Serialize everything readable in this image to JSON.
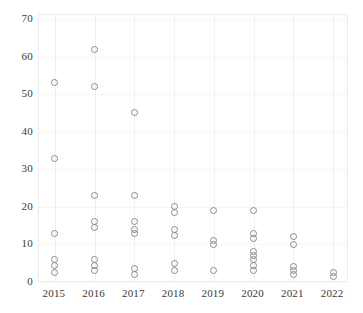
{
  "chart_data": {
    "type": "scatter",
    "title": "",
    "subtitle": "",
    "xlabel": "",
    "ylabel": "",
    "xlim": [
      2014.6,
      2022.4
    ],
    "ylim": [
      0,
      70
    ],
    "yticks": [
      0,
      10,
      20,
      30,
      40,
      50,
      60,
      70
    ],
    "xticks": [
      2015,
      2016,
      2017,
      2018,
      2019,
      2020,
      2021,
      2022
    ],
    "ytick_labels": [
      "0",
      "10",
      "20",
      "30",
      "40",
      "50",
      "60",
      "70"
    ],
    "xtick_labels": [
      "2015",
      "2016",
      "2017",
      "2018",
      "2019",
      "2020",
      "2021",
      "2022"
    ],
    "grid": "light vertical gridlines at each year, faint horizontal gridlines",
    "legend": "none",
    "marker_style": "open circle",
    "marker_color": "#8a8a8a",
    "series": [
      {
        "name": "observations",
        "points": [
          {
            "x": 2015,
            "y": 53
          },
          {
            "x": 2015,
            "y": 33
          },
          {
            "x": 2015,
            "y": 13
          },
          {
            "x": 2015,
            "y": 6
          },
          {
            "x": 2015,
            "y": 4.5
          },
          {
            "x": 2015,
            "y": 2.5
          },
          {
            "x": 2016,
            "y": 62
          },
          {
            "x": 2016,
            "y": 52
          },
          {
            "x": 2016,
            "y": 23
          },
          {
            "x": 2016,
            "y": 16
          },
          {
            "x": 2016,
            "y": 14.5
          },
          {
            "x": 2016,
            "y": 6
          },
          {
            "x": 2016,
            "y": 4.5
          },
          {
            "x": 2016,
            "y": 3
          },
          {
            "x": 2017,
            "y": 45
          },
          {
            "x": 2017,
            "y": 23
          },
          {
            "x": 2017,
            "y": 16
          },
          {
            "x": 2017,
            "y": 14
          },
          {
            "x": 2017,
            "y": 13
          },
          {
            "x": 2017,
            "y": 3.5
          },
          {
            "x": 2017,
            "y": 2
          },
          {
            "x": 2018,
            "y": 20
          },
          {
            "x": 2018,
            "y": 18.5
          },
          {
            "x": 2018,
            "y": 14
          },
          {
            "x": 2018,
            "y": 12.5
          },
          {
            "x": 2018,
            "y": 5
          },
          {
            "x": 2018,
            "y": 3
          },
          {
            "x": 2019,
            "y": 19
          },
          {
            "x": 2019,
            "y": 11
          },
          {
            "x": 2019,
            "y": 10
          },
          {
            "x": 2019,
            "y": 3
          },
          {
            "x": 2020,
            "y": 19
          },
          {
            "x": 2020,
            "y": 13
          },
          {
            "x": 2020,
            "y": 11.5
          },
          {
            "x": 2020,
            "y": 8
          },
          {
            "x": 2020,
            "y": 7
          },
          {
            "x": 2020,
            "y": 6
          },
          {
            "x": 2020,
            "y": 4.5
          },
          {
            "x": 2020,
            "y": 3
          },
          {
            "x": 2021,
            "y": 12
          },
          {
            "x": 2021,
            "y": 10
          },
          {
            "x": 2021,
            "y": 4
          },
          {
            "x": 2021,
            "y": 3
          },
          {
            "x": 2021,
            "y": 2
          },
          {
            "x": 2022,
            "y": 2.5
          },
          {
            "x": 2022,
            "y": 1.5
          }
        ]
      }
    ]
  }
}
